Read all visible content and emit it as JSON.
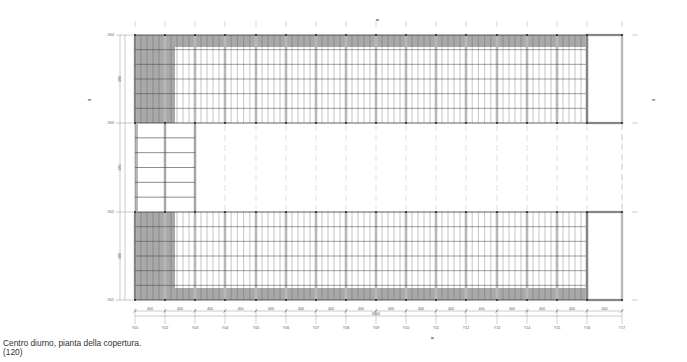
{
  "caption": {
    "title": "Centro diurno, pianta della copertura.",
    "scale": "(120)"
  },
  "colors": {
    "shaded_panel": "#a9a9a9",
    "structure_line": "#3a3a3a",
    "mullion": "#b8b8b8",
    "dim_line": "#7a7a7a",
    "background": "#ffffff"
  },
  "grid": {
    "rows": [
      {
        "id": "X04",
        "y": 35
      },
      {
        "id": "X03",
        "y": 123
      },
      {
        "id": "X02",
        "y": 212
      },
      {
        "id": "X01",
        "y": 300
      }
    ],
    "columns": [
      {
        "id": "Y01",
        "x": 135
      },
      {
        "id": "Y02",
        "x": 165
      },
      {
        "id": "Y03",
        "x": 195
      },
      {
        "id": "Y04",
        "x": 225
      },
      {
        "id": "Y05",
        "x": 256
      },
      {
        "id": "Y06",
        "x": 286
      },
      {
        "id": "Y07",
        "x": 316
      },
      {
        "id": "Y08",
        "x": 346
      },
      {
        "id": "Y09",
        "x": 376
      },
      {
        "id": "Y10",
        "x": 406
      },
      {
        "id": "Y11",
        "x": 436
      },
      {
        "id": "Y12",
        "x": 466
      },
      {
        "id": "Y13",
        "x": 497
      },
      {
        "id": "Y14",
        "x": 527
      },
      {
        "id": "Y15",
        "x": 557
      },
      {
        "id": "Y16",
        "x": 587
      },
      {
        "id": "Y17",
        "x": 622
      }
    ],
    "bay_dimension": "400",
    "last_bay_dimension": "400",
    "overall_dimension": "6400",
    "vertical_dimensions": [
      "380",
      "380",
      "380"
    ],
    "section_marker_top": "A",
    "section_marker_bottom": "A",
    "section_marker_left": "B",
    "section_marker_right": "B"
  }
}
